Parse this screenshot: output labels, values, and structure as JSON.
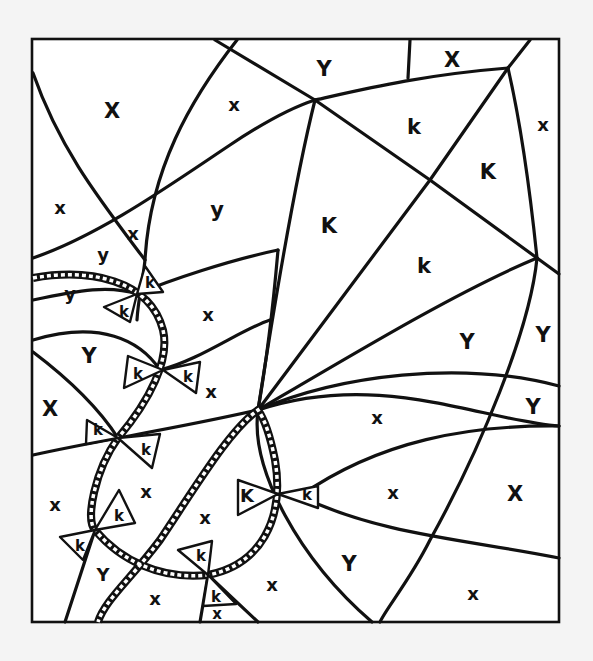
{
  "page": {
    "type": "color-by-letter coloring sheet",
    "colors": {
      "background": "#f4f4f4",
      "paper": "#ffffff",
      "ink": "#111111"
    }
  },
  "regions": [
    {
      "letter": "X",
      "x": 112,
      "y": 111,
      "size": "big"
    },
    {
      "letter": "x",
      "x": 234,
      "y": 105,
      "size": "mid"
    },
    {
      "letter": "Y",
      "x": 324,
      "y": 69,
      "size": "big"
    },
    {
      "letter": "X",
      "x": 452,
      "y": 60,
      "size": "big"
    },
    {
      "letter": "k",
      "x": 414,
      "y": 127,
      "size": "big"
    },
    {
      "letter": "x",
      "x": 543,
      "y": 125,
      "size": "mid"
    },
    {
      "letter": "K",
      "x": 488,
      "y": 172,
      "size": "big"
    },
    {
      "letter": "x",
      "x": 60,
      "y": 208,
      "size": "mid"
    },
    {
      "letter": "y",
      "x": 217,
      "y": 210,
      "size": "big"
    },
    {
      "letter": "K",
      "x": 329,
      "y": 226,
      "size": "big"
    },
    {
      "letter": "x",
      "x": 133,
      "y": 234,
      "size": "mid"
    },
    {
      "letter": "y",
      "x": 103,
      "y": 255,
      "size": "mid"
    },
    {
      "letter": "k",
      "x": 424,
      "y": 266,
      "size": "big"
    },
    {
      "letter": "y",
      "x": 70,
      "y": 294,
      "size": "mid"
    },
    {
      "letter": "k",
      "x": 150,
      "y": 283,
      "size": "sm"
    },
    {
      "letter": "k",
      "x": 124,
      "y": 312,
      "size": "sm"
    },
    {
      "letter": "x",
      "x": 208,
      "y": 315,
      "size": "mid"
    },
    {
      "letter": "Y",
      "x": 467,
      "y": 342,
      "size": "big"
    },
    {
      "letter": "Y",
      "x": 543,
      "y": 335,
      "size": "big"
    },
    {
      "letter": "Y",
      "x": 89,
      "y": 356,
      "size": "big"
    },
    {
      "letter": "k",
      "x": 138,
      "y": 374,
      "size": "sm"
    },
    {
      "letter": "k",
      "x": 188,
      "y": 377,
      "size": "sm"
    },
    {
      "letter": "x",
      "x": 211,
      "y": 392,
      "size": "mid"
    },
    {
      "letter": "X",
      "x": 50,
      "y": 409,
      "size": "big"
    },
    {
      "letter": "Y",
      "x": 533,
      "y": 407,
      "size": "big"
    },
    {
      "letter": "x",
      "x": 377,
      "y": 418,
      "size": "mid"
    },
    {
      "letter": "k",
      "x": 98,
      "y": 430,
      "size": "sm"
    },
    {
      "letter": "k",
      "x": 146,
      "y": 450,
      "size": "sm"
    },
    {
      "letter": "x",
      "x": 146,
      "y": 492,
      "size": "mid"
    },
    {
      "letter": "K",
      "x": 247,
      "y": 496,
      "size": "mid"
    },
    {
      "letter": "k",
      "x": 307,
      "y": 495,
      "size": "sm"
    },
    {
      "letter": "x",
      "x": 393,
      "y": 493,
      "size": "mid"
    },
    {
      "letter": "X",
      "x": 515,
      "y": 494,
      "size": "big"
    },
    {
      "letter": "x",
      "x": 55,
      "y": 505,
      "size": "mid"
    },
    {
      "letter": "k",
      "x": 119,
      "y": 516,
      "size": "sm"
    },
    {
      "letter": "x",
      "x": 205,
      "y": 518,
      "size": "mid"
    },
    {
      "letter": "k",
      "x": 80,
      "y": 546,
      "size": "sm"
    },
    {
      "letter": "k",
      "x": 201,
      "y": 556,
      "size": "sm"
    },
    {
      "letter": "Y",
      "x": 349,
      "y": 564,
      "size": "big"
    },
    {
      "letter": "Y",
      "x": 103,
      "y": 575,
      "size": "mid"
    },
    {
      "letter": "x",
      "x": 272,
      "y": 585,
      "size": "mid"
    },
    {
      "letter": "x",
      "x": 155,
      "y": 599,
      "size": "mid"
    },
    {
      "letter": "k",
      "x": 216,
      "y": 597,
      "size": "sm"
    },
    {
      "letter": "x",
      "x": 473,
      "y": 594,
      "size": "mid"
    },
    {
      "letter": "x",
      "x": 217,
      "y": 614,
      "size": "sm"
    }
  ]
}
